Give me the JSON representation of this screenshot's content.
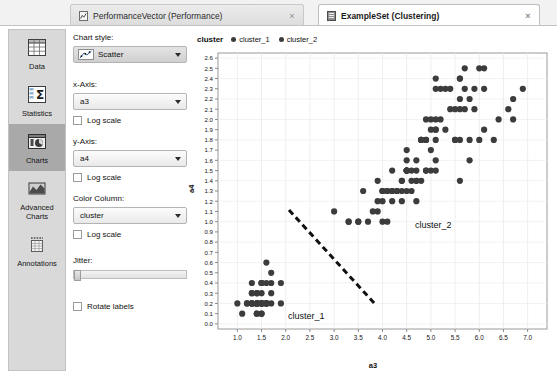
{
  "tabs": [
    {
      "label": "PerformanceVector (Performance)",
      "icon": "performance-vector-icon",
      "close": "×",
      "active": false
    },
    {
      "label": "ExampleSet (Clustering)",
      "icon": "exampleset-icon",
      "close": "×",
      "active": true
    }
  ],
  "sidebar": {
    "items": [
      {
        "label": "Data",
        "icon": "table-grid-icon",
        "selected": false
      },
      {
        "label": "Statistics",
        "icon": "sigma-statistics-icon",
        "selected": false
      },
      {
        "label": "Charts",
        "icon": "pie-chart-icon",
        "selected": true
      },
      {
        "label": "Advanced\nCharts",
        "icon": "advanced-chart-icon",
        "selected": false
      },
      {
        "label": "Annotations",
        "icon": "annotations-icon",
        "selected": false
      }
    ]
  },
  "options": {
    "chart_style_label": "Chart style:",
    "chart_style_value": "Scatter",
    "x_axis_label": "x-Axis:",
    "x_axis_value": "a3",
    "x_log_label": "Log scale",
    "y_axis_label": "y-Axis:",
    "y_axis_value": "a4",
    "y_log_label": "Log scale",
    "color_column_label": "Color Column:",
    "color_column_value": "cluster",
    "color_log_label": "Log scale",
    "jitter_label": "Jitter:",
    "jitter_value": 0,
    "rotate_labels_label": "Rotate labels"
  },
  "legend": {
    "title": "cluster",
    "entries": [
      {
        "label": "cluster_1",
        "color": "#3c3c3c"
      },
      {
        "label": "cluster_2",
        "color": "#3c3c3c"
      }
    ]
  },
  "annotations": [
    {
      "name": "cluster-1-annotation",
      "text": "cluster_1",
      "x": 95,
      "y": 282
    },
    {
      "name": "cluster-2-annotation",
      "text": "cluster_2",
      "x": 222,
      "y": 191
    }
  ],
  "separator_line": {
    "x1": 96,
    "y1": 181,
    "x2": 182,
    "y2": 275,
    "color": "#111111",
    "dash": "6 4",
    "width": 3
  },
  "chart_data": {
    "type": "scatter",
    "title": "",
    "xlabel": "a3",
    "ylabel": "a4",
    "xlim": [
      0.6,
      7.4
    ],
    "ylim": [
      -0.05,
      2.65
    ],
    "xticks": [
      1.0,
      1.5,
      2.0,
      2.5,
      3.0,
      3.5,
      4.0,
      4.5,
      5.0,
      5.5,
      6.0,
      6.5,
      7.0
    ],
    "xticklabels": [
      "1.0",
      "1.5",
      "2.0",
      "2.5",
      "3.0",
      "3.5",
      "4.0",
      "4.5",
      "5.0",
      "5.5",
      "6.0",
      "6.5",
      "7.0"
    ],
    "yticks": [
      0.0,
      0.1,
      0.2,
      0.3,
      0.4,
      0.5,
      0.6,
      0.7,
      0.8,
      0.9,
      1.0,
      1.1,
      1.2,
      1.3,
      1.4,
      1.5,
      1.6,
      1.7,
      1.8,
      1.9,
      2.0,
      2.1,
      2.2,
      2.3,
      2.4,
      2.5,
      2.6
    ],
    "yticklabels": [
      "0.0",
      "0.1",
      "0.2",
      "0.3",
      "0.4",
      "0.5",
      "0.6",
      "0.7",
      "0.8",
      "0.9",
      "1.0",
      "1.1",
      "1.2",
      "1.3",
      "1.4",
      "1.5",
      "1.6",
      "1.7",
      "1.8",
      "1.9",
      "2.0",
      "2.1",
      "2.2",
      "2.3",
      "2.4",
      "2.5",
      "2.6"
    ],
    "grid": true,
    "legend_position": "top-left",
    "marker": "circle",
    "marker_size": 3.1,
    "series": [
      {
        "name": "cluster_1",
        "color": "#3c3c3c",
        "points": [
          [
            1.4,
            0.2
          ],
          [
            1.4,
            0.2
          ],
          [
            1.3,
            0.2
          ],
          [
            1.5,
            0.2
          ],
          [
            1.4,
            0.2
          ],
          [
            1.7,
            0.4
          ],
          [
            1.4,
            0.3
          ],
          [
            1.5,
            0.2
          ],
          [
            1.4,
            0.2
          ],
          [
            1.5,
            0.1
          ],
          [
            1.5,
            0.2
          ],
          [
            1.6,
            0.2
          ],
          [
            1.4,
            0.1
          ],
          [
            1.1,
            0.1
          ],
          [
            1.2,
            0.2
          ],
          [
            1.5,
            0.4
          ],
          [
            1.3,
            0.4
          ],
          [
            1.4,
            0.3
          ],
          [
            1.7,
            0.3
          ],
          [
            1.5,
            0.3
          ],
          [
            1.7,
            0.2
          ],
          [
            1.5,
            0.4
          ],
          [
            1.0,
            0.2
          ],
          [
            1.7,
            0.5
          ],
          [
            1.9,
            0.2
          ],
          [
            1.6,
            0.2
          ],
          [
            1.6,
            0.4
          ],
          [
            1.5,
            0.2
          ],
          [
            1.4,
            0.2
          ],
          [
            1.6,
            0.2
          ],
          [
            1.6,
            0.2
          ],
          [
            1.5,
            0.4
          ],
          [
            1.5,
            0.1
          ],
          [
            1.4,
            0.2
          ],
          [
            1.5,
            0.2
          ],
          [
            1.2,
            0.2
          ],
          [
            1.3,
            0.2
          ],
          [
            1.4,
            0.1
          ],
          [
            1.3,
            0.2
          ],
          [
            1.5,
            0.2
          ],
          [
            1.3,
            0.3
          ],
          [
            1.3,
            0.3
          ],
          [
            1.3,
            0.2
          ],
          [
            1.6,
            0.6
          ],
          [
            1.9,
            0.4
          ],
          [
            1.4,
            0.3
          ],
          [
            1.6,
            0.2
          ],
          [
            1.4,
            0.2
          ],
          [
            1.5,
            0.2
          ],
          [
            1.4,
            0.2
          ]
        ]
      },
      {
        "name": "cluster_2",
        "color": "#3c3c3c",
        "points": [
          [
            4.7,
            1.4
          ],
          [
            4.5,
            1.5
          ],
          [
            4.9,
            1.5
          ],
          [
            4.0,
            1.3
          ],
          [
            4.6,
            1.5
          ],
          [
            4.5,
            1.3
          ],
          [
            4.7,
            1.6
          ],
          [
            3.3,
            1.0
          ],
          [
            4.6,
            1.3
          ],
          [
            3.9,
            1.4
          ],
          [
            3.5,
            1.0
          ],
          [
            4.2,
            1.5
          ],
          [
            4.0,
            1.0
          ],
          [
            4.7,
            1.4
          ],
          [
            3.6,
            1.3
          ],
          [
            4.4,
            1.4
          ],
          [
            4.5,
            1.5
          ],
          [
            4.1,
            1.0
          ],
          [
            4.5,
            1.5
          ],
          [
            3.9,
            1.1
          ],
          [
            4.8,
            1.8
          ],
          [
            4.0,
            1.3
          ],
          [
            4.9,
            1.5
          ],
          [
            4.7,
            1.2
          ],
          [
            4.3,
            1.3
          ],
          [
            4.4,
            1.4
          ],
          [
            4.8,
            1.4
          ],
          [
            5.0,
            1.7
          ],
          [
            4.5,
            1.5
          ],
          [
            3.5,
            1.0
          ],
          [
            3.8,
            1.1
          ],
          [
            3.7,
            1.0
          ],
          [
            3.9,
            1.2
          ],
          [
            5.1,
            1.6
          ],
          [
            4.5,
            1.5
          ],
          [
            4.5,
            1.6
          ],
          [
            4.7,
            1.5
          ],
          [
            4.4,
            1.3
          ],
          [
            4.1,
            1.3
          ],
          [
            4.0,
            1.3
          ],
          [
            4.4,
            1.2
          ],
          [
            4.6,
            1.4
          ],
          [
            4.0,
            1.2
          ],
          [
            3.3,
            1.0
          ],
          [
            4.2,
            1.3
          ],
          [
            4.2,
            1.2
          ],
          [
            4.2,
            1.3
          ],
          [
            4.3,
            1.3
          ],
          [
            3.0,
            1.1
          ],
          [
            4.1,
            1.3
          ],
          [
            6.0,
            2.5
          ],
          [
            5.1,
            1.9
          ],
          [
            5.9,
            2.1
          ],
          [
            5.6,
            1.8
          ],
          [
            5.8,
            2.2
          ],
          [
            6.6,
            2.1
          ],
          [
            4.5,
            1.7
          ],
          [
            6.3,
            1.8
          ],
          [
            5.8,
            1.8
          ],
          [
            6.1,
            2.5
          ],
          [
            5.1,
            2.0
          ],
          [
            5.3,
            1.9
          ],
          [
            5.5,
            2.1
          ],
          [
            5.0,
            2.0
          ],
          [
            5.1,
            2.4
          ],
          [
            5.3,
            2.3
          ],
          [
            5.5,
            1.8
          ],
          [
            6.7,
            2.2
          ],
          [
            6.9,
            2.3
          ],
          [
            5.0,
            1.5
          ],
          [
            5.7,
            2.3
          ],
          [
            4.9,
            2.0
          ],
          [
            6.7,
            2.0
          ],
          [
            4.9,
            1.8
          ],
          [
            5.7,
            2.1
          ],
          [
            6.0,
            1.8
          ],
          [
            4.8,
            1.8
          ],
          [
            4.9,
            1.8
          ],
          [
            5.6,
            2.1
          ],
          [
            5.8,
            1.6
          ],
          [
            6.1,
            1.9
          ],
          [
            6.4,
            2.0
          ],
          [
            5.6,
            2.2
          ],
          [
            5.1,
            1.5
          ],
          [
            5.6,
            1.4
          ],
          [
            6.1,
            2.3
          ],
          [
            5.6,
            2.4
          ],
          [
            5.5,
            1.8
          ],
          [
            4.8,
            1.8
          ],
          [
            5.4,
            2.1
          ],
          [
            5.6,
            2.4
          ],
          [
            5.1,
            2.3
          ],
          [
            5.1,
            1.9
          ],
          [
            5.9,
            2.3
          ],
          [
            5.7,
            2.5
          ],
          [
            5.2,
            2.3
          ],
          [
            5.0,
            1.9
          ],
          [
            5.2,
            2.0
          ],
          [
            5.4,
            2.3
          ],
          [
            5.1,
            1.8
          ]
        ]
      }
    ]
  }
}
